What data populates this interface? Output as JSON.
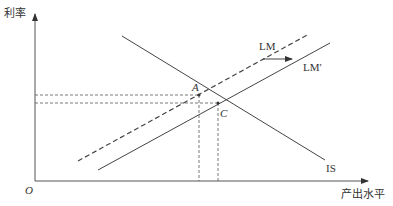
{
  "diagram": {
    "type": "IS-LM model",
    "axes": {
      "y_label": "利率",
      "x_label": "产出水平",
      "origin_label": "O"
    },
    "curves": [
      {
        "name": "IS",
        "label": "IS",
        "style": "solid"
      },
      {
        "name": "LM",
        "label": "LM",
        "style": "dashed"
      },
      {
        "name": "LM_prime",
        "label": "LM′",
        "style": "solid"
      }
    ],
    "points": [
      {
        "label": "A",
        "description": "Intersection of IS and LM"
      },
      {
        "label": "C",
        "description": "Intersection of IS and LM′"
      }
    ],
    "annotations": {
      "shift_arrow": "LM shifts right to LM′"
    },
    "colors": {
      "line": "#444444",
      "text": "#333333",
      "background": "#ffffff"
    }
  }
}
